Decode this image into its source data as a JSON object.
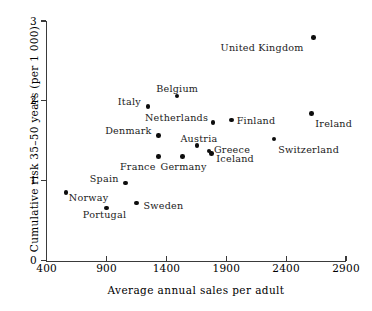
{
  "chart_data": {
    "type": "scatter",
    "title": "",
    "xlabel": "Average annual sales per adult",
    "ylabel": "Cumulative risk 35–50 years (per 1 000)",
    "xlim": [
      400,
      2900
    ],
    "ylim": [
      0,
      3
    ],
    "xticks": [
      "400",
      "900",
      "1400",
      "1900",
      "2400",
      "2900"
    ],
    "xtick_values": [
      400,
      900,
      1400,
      1900,
      2400,
      2900
    ],
    "yticks": [
      "0",
      "1",
      "2",
      "3"
    ],
    "ytick_values": [
      0,
      1,
      2,
      3
    ],
    "grid": false,
    "legend": false,
    "points": [
      {
        "name": "Norway",
        "x": 560,
        "y": 0.85,
        "label_dx": 3,
        "label_dy": 5,
        "align": "left"
      },
      {
        "name": "Portugal",
        "x": 900,
        "y": 0.66,
        "label_dx": -2,
        "label_dy": 7,
        "align": "center"
      },
      {
        "name": "Spain",
        "x": 1060,
        "y": 0.97,
        "label_dx": -7,
        "label_dy": -4,
        "align": "right"
      },
      {
        "name": "Sweden",
        "x": 1150,
        "y": 0.72,
        "label_dx": 7,
        "label_dy": 3,
        "align": "left"
      },
      {
        "name": "France",
        "x": 1335,
        "y": 1.3,
        "label_dx": -3,
        "label_dy": 10,
        "align": "right"
      },
      {
        "name": "Italy",
        "x": 1245,
        "y": 1.93,
        "label_dx": -7,
        "label_dy": -4,
        "align": "right"
      },
      {
        "name": "Denmark",
        "x": 1335,
        "y": 1.57,
        "label_dx": -7,
        "label_dy": -4,
        "align": "right"
      },
      {
        "name": "Belgium",
        "x": 1490,
        "y": 2.06,
        "label_dx": 0,
        "label_dy": -7,
        "align": "center"
      },
      {
        "name": "Germany",
        "x": 1535,
        "y": 1.3,
        "label_dx": 1,
        "label_dy": 10,
        "align": "center"
      },
      {
        "name": "Austria",
        "x": 1655,
        "y": 1.44,
        "label_dx": 2,
        "label_dy": -7,
        "align": "center"
      },
      {
        "name": "Netherlands",
        "x": 1790,
        "y": 1.73,
        "label_dx": -5,
        "label_dy": -4,
        "align": "right"
      },
      {
        "name": "Greece",
        "x": 1755,
        "y": 1.37,
        "label_dx": 5,
        "label_dy": -1,
        "align": "left"
      },
      {
        "name": "Iceland",
        "x": 1775,
        "y": 1.34,
        "label_dx": 5,
        "label_dy": 5,
        "align": "left"
      },
      {
        "name": "Finland",
        "x": 1945,
        "y": 1.76,
        "label_dx": 5,
        "label_dy": 1,
        "align": "left"
      },
      {
        "name": "Switzerland",
        "x": 2300,
        "y": 1.52,
        "label_dx": 4,
        "label_dy": 11,
        "align": "left"
      },
      {
        "name": "Ireland",
        "x": 2610,
        "y": 1.84,
        "label_dx": 4,
        "label_dy": 10,
        "align": "left"
      },
      {
        "name": "United Kingdom",
        "x": 2630,
        "y": 2.79,
        "label_dx": -10,
        "label_dy": 10,
        "align": "right"
      }
    ]
  }
}
